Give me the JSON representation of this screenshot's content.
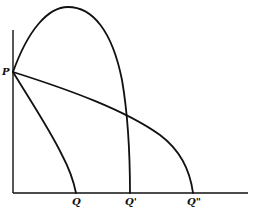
{
  "diagram": {
    "type": "economics-curves",
    "axes": {
      "origin": [
        13,
        193
      ],
      "x_end": 248,
      "y_top": 30
    },
    "point_label": "P",
    "x_labels": [
      {
        "id": "Q",
        "text": "Q",
        "x": 76
      },
      {
        "id": "Q1",
        "text": "Q'",
        "x": 130
      },
      {
        "id": "Q2",
        "text": "Q\"",
        "x": 193
      }
    ],
    "curves": [
      {
        "name": "P to Q",
        "from": "P",
        "to": "Q",
        "shape": "concave steep curve"
      },
      {
        "name": "P to Q'",
        "from": "P",
        "to": "Q'",
        "shape": "tall hump peaking near top"
      },
      {
        "name": "P to Q\"",
        "from": "P",
        "to": "Q\"",
        "shape": "gentle concave arc"
      }
    ],
    "colors": {
      "line": "#111111",
      "background": "#ffffff"
    }
  }
}
